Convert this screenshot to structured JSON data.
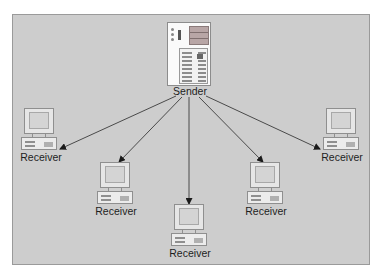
{
  "diagram": {
    "title": "",
    "type": "one-to-many broadcast",
    "background_color": "#cdcdcd",
    "border_color": "#9a9a9a",
    "arrow_color": "#3c3c3c",
    "sender": {
      "label": "Sender",
      "icon": "server-icon"
    },
    "receivers": [
      {
        "label": "Receiver",
        "icon": "computer-icon"
      },
      {
        "label": "Receiver",
        "icon": "computer-icon"
      },
      {
        "label": "Receiver",
        "icon": "computer-icon"
      },
      {
        "label": "Receiver",
        "icon": "computer-icon"
      },
      {
        "label": "Receiver",
        "icon": "computer-icon"
      }
    ],
    "edges": [
      {
        "from": "Sender",
        "to": "Receiver 1",
        "directed": true
      },
      {
        "from": "Sender",
        "to": "Receiver 2",
        "directed": true
      },
      {
        "from": "Sender",
        "to": "Receiver 3",
        "directed": true
      },
      {
        "from": "Sender",
        "to": "Receiver 4",
        "directed": true
      },
      {
        "from": "Sender",
        "to": "Receiver 5",
        "directed": true
      }
    ]
  }
}
